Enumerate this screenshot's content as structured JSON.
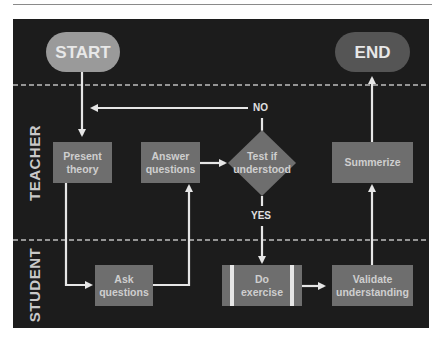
{
  "diagram": {
    "type": "swimlane-flowchart",
    "lanes": [
      {
        "label": "TEACHER"
      },
      {
        "label": "STUDENT"
      }
    ],
    "nodes": {
      "start": "START",
      "end": "END",
      "present_theory": "Present theory",
      "answer_questions": "Answer questions",
      "test_understood": "Test if understood",
      "summerize": "Summerize",
      "ask_questions": "Ask questions",
      "do_exercise": "Do exercise",
      "validate_understanding": "Validate understanding"
    },
    "edge_labels": {
      "no": "NO",
      "yes": "YES"
    },
    "edges": [
      [
        "START",
        "Present theory"
      ],
      [
        "Present theory",
        "Ask questions"
      ],
      [
        "Ask questions",
        "Answer questions"
      ],
      [
        "Answer questions",
        "Test if understood"
      ],
      [
        "Test if understood",
        "Present theory",
        "NO"
      ],
      [
        "Test if understood",
        "Do exercise",
        "YES"
      ],
      [
        "Do exercise",
        "Validate understanding"
      ],
      [
        "Validate understanding",
        "Summerize"
      ],
      [
        "Summerize",
        "END"
      ]
    ],
    "colors": {
      "background": "#1c1c1c",
      "process": "#6e6e6e",
      "start_terminal": "#9a9a9a",
      "end_terminal": "#555555",
      "arrows": "#e6e6e6"
    }
  }
}
